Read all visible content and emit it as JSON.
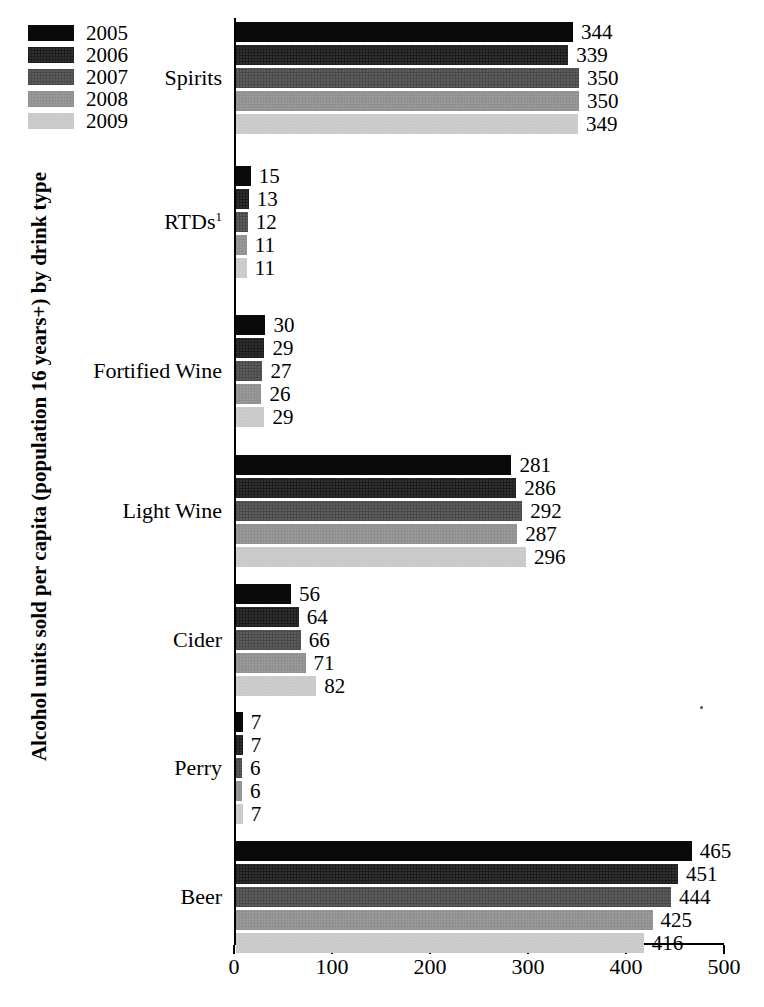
{
  "chart_data": {
    "type": "bar",
    "orientation": "horizontal",
    "title": "",
    "xlabel": "",
    "ylabel": "Alcohol units sold per capita (population 16 years+) by drink type",
    "xlim": [
      0,
      500
    ],
    "xticks": [
      0,
      100,
      200,
      300,
      400,
      500
    ],
    "grid": false,
    "legend_position": "top-left",
    "categories": [
      "Spirits",
      "RTDs¹",
      "Fortified Wine",
      "Light Wine",
      "Cider",
      "Perry",
      "Beer"
    ],
    "category_labels_html": [
      {
        "text": "Spirits",
        "sup": ""
      },
      {
        "text": "RTDs",
        "sup": "1"
      },
      {
        "text": "Fortified Wine",
        "sup": ""
      },
      {
        "text": "Light Wine",
        "sup": ""
      },
      {
        "text": "Cider",
        "sup": ""
      },
      {
        "text": "Perry",
        "sup": ""
      },
      {
        "text": "Beer",
        "sup": ""
      }
    ],
    "series": [
      {
        "name": "2005",
        "color": "#0a0a0a",
        "values": [
          344,
          15,
          30,
          281,
          56,
          7,
          465
        ]
      },
      {
        "name": "2006",
        "color": "#1e1e1e",
        "values": [
          339,
          13,
          29,
          286,
          64,
          7,
          451
        ]
      },
      {
        "name": "2007",
        "color": "#4a4a4a",
        "values": [
          350,
          12,
          27,
          292,
          66,
          6,
          444
        ]
      },
      {
        "name": "2008",
        "color": "#8f8f8f",
        "values": [
          350,
          11,
          26,
          287,
          71,
          6,
          425
        ]
      },
      {
        "name": "2009",
        "color": "#c9c9c9",
        "values": [
          349,
          11,
          29,
          296,
          82,
          7,
          416
        ]
      }
    ]
  },
  "legend": {
    "items": [
      {
        "label": "2005",
        "color": "#0a0a0a"
      },
      {
        "label": "2006",
        "color": "#1e1e1e"
      },
      {
        "label": "2007",
        "color": "#4a4a4a"
      },
      {
        "label": "2008",
        "color": "#8f8f8f"
      },
      {
        "label": "2009",
        "color": "#c9c9c9"
      }
    ]
  },
  "axis": {
    "y_title": "Alcohol units sold per capita (population 16 years+) by drink type",
    "x_tick_labels": [
      "0",
      "100",
      "200",
      "300",
      "400",
      "500"
    ]
  }
}
